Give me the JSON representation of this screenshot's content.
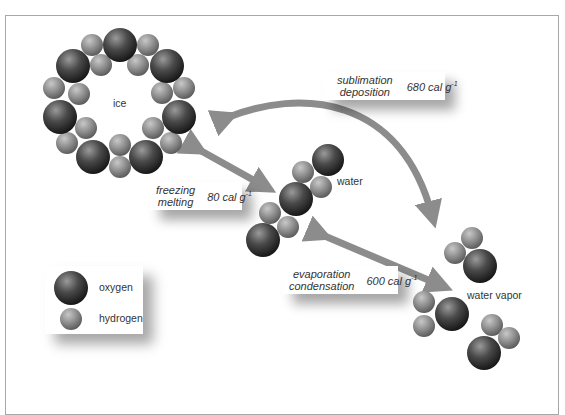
{
  "molecules": {
    "ice_label": "ice",
    "water_label": "water",
    "vapor_label": "water vapor"
  },
  "transitions": {
    "sublimation": {
      "process_1": "sublimation",
      "process_2": "deposition",
      "energy_value": "680 cal g",
      "energy_exponent": "-1"
    },
    "freezing": {
      "process_1": "freezing",
      "process_2": "melting",
      "energy_value": "80 cal g",
      "energy_exponent": "-1"
    },
    "evaporation": {
      "process_1": "evaporation",
      "process_2": "condensation",
      "energy_value": "600 cal g",
      "energy_exponent": "-1"
    }
  },
  "legend": {
    "oxygen_label": "oxygen",
    "hydrogen_label": "hydrogen"
  },
  "colors": {
    "oxygen": "#3a3a3a",
    "hydrogen": "#8a8a8a",
    "arrow": "#8c8c8c",
    "frame": "#a8a8a8"
  }
}
